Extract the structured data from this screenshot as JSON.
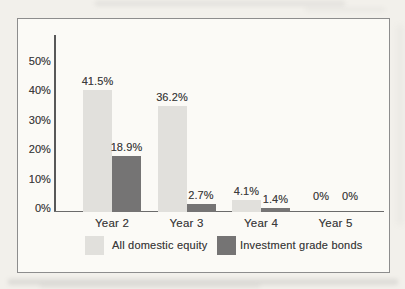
{
  "chart_data": {
    "type": "bar",
    "title": "",
    "xlabel": "",
    "ylabel": "",
    "categories": [
      "Year 2",
      "Year 3",
      "Year 4",
      "Year 5"
    ],
    "series": [
      {
        "name": "All domestic equity",
        "color": "#e1e0dc",
        "values": [
          41.5,
          36.2,
          4.1,
          0
        ],
        "labels": [
          "41.5%",
          "36.2%",
          "4.1%",
          "0%"
        ]
      },
      {
        "name": "Investment grade bonds",
        "color": "#757474",
        "values": [
          18.9,
          2.7,
          1.4,
          0
        ],
        "labels": [
          "18.9%",
          "2.7%",
          "1.4%",
          "0%"
        ]
      }
    ],
    "yticks": [
      {
        "value": 0,
        "label": "0%"
      },
      {
        "value": 10,
        "label": "10%"
      },
      {
        "value": 20,
        "label": "20%"
      },
      {
        "value": 30,
        "label": "30%"
      },
      {
        "value": 40,
        "label": "40%"
      },
      {
        "value": 50,
        "label": "50%"
      }
    ],
    "ylim": [
      0,
      60
    ],
    "grid": false,
    "legend_position": "bottom-inside"
  }
}
